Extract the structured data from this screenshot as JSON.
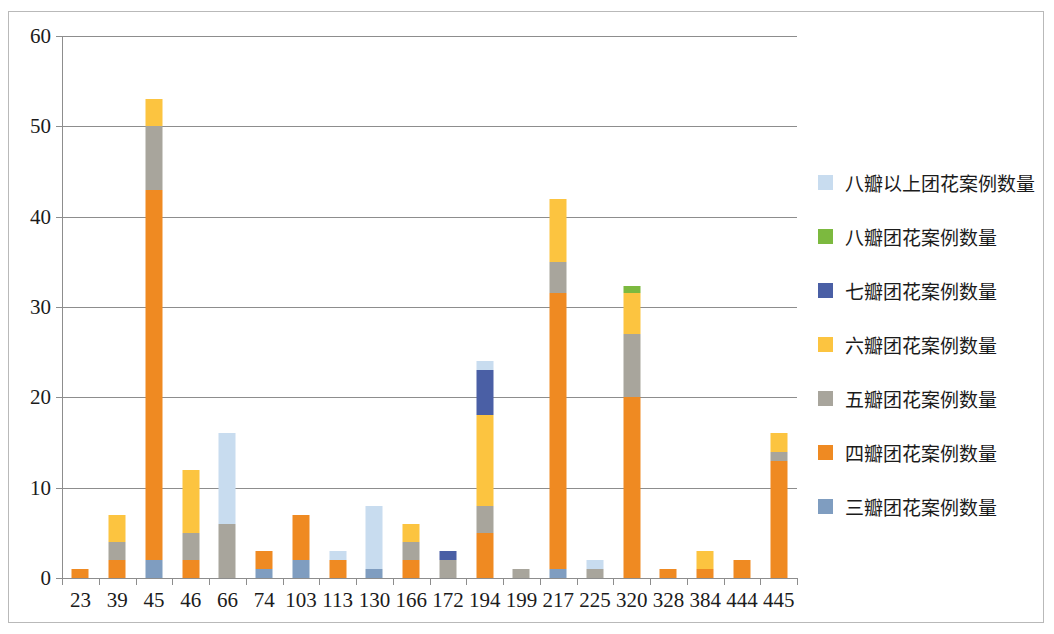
{
  "chart_data": {
    "type": "bar",
    "subtype": "stacked-bar",
    "title": "",
    "xlabel": "",
    "ylabel": "",
    "ylim": [
      0,
      60
    ],
    "ytick_step": 10,
    "yticks": [
      0,
      10,
      20,
      30,
      40,
      50,
      60
    ],
    "grid": true,
    "grid_axis": "y",
    "legend_position": "right",
    "categories": [
      "23",
      "39",
      "45",
      "46",
      "66",
      "74",
      "103",
      "113",
      "130",
      "166",
      "172",
      "194",
      "199",
      "217",
      "225",
      "320",
      "328",
      "384",
      "444",
      "445"
    ],
    "series": [
      {
        "name": "三瓣团花案例数量",
        "color": "#7f9dc0",
        "values": [
          0,
          0,
          2,
          0,
          0,
          1,
          2,
          0,
          1,
          0,
          0,
          0,
          0,
          1,
          0,
          0,
          0,
          0,
          0,
          0
        ]
      },
      {
        "name": "四瓣团花案例数量",
        "color": "#ef8a22",
        "values": [
          1,
          2,
          41,
          2,
          0,
          2,
          5,
          2,
          0,
          2,
          0,
          5,
          0,
          30.5,
          0,
          20,
          1,
          1,
          2,
          13
        ]
      },
      {
        "name": "五瓣团花案例数量",
        "color": "#a8a59c",
        "values": [
          0,
          2,
          7,
          3,
          6,
          0,
          0,
          0,
          0,
          2,
          2,
          3,
          1,
          3.5,
          1,
          7,
          0,
          0,
          0,
          1
        ]
      },
      {
        "name": "六瓣团花案例数量",
        "color": "#fcc440",
        "values": [
          0,
          3,
          3,
          7,
          0,
          0,
          0,
          0,
          0,
          2,
          0,
          10,
          0,
          7,
          0,
          4.5,
          0,
          2,
          0,
          2
        ]
      },
      {
        "name": "七瓣团花案例数量",
        "color": "#4a5fa5",
        "values": [
          0,
          0,
          0,
          0,
          0,
          0,
          0,
          0,
          0,
          0,
          1,
          5,
          0,
          0,
          0,
          0,
          0,
          0,
          0,
          0
        ]
      },
      {
        "name": "八瓣团花案例数量",
        "color": "#7cb93f",
        "values": [
          0,
          0,
          0,
          0,
          0,
          0,
          0,
          0,
          0,
          0,
          0,
          0,
          0,
          0,
          0,
          0.8,
          0,
          0,
          0,
          0
        ]
      },
      {
        "name": "八瓣以上团花案例数量",
        "color": "#c8dcef",
        "values": [
          0,
          0,
          0,
          0,
          10,
          0,
          0,
          1,
          7,
          0,
          0,
          1,
          0,
          0,
          1,
          0,
          0,
          0,
          0,
          0
        ]
      }
    ],
    "totals": [
      1,
      7,
      53,
      12,
      16,
      3,
      7,
      3,
      8,
      6,
      3,
      24,
      1,
      42,
      2,
      32.3,
      1,
      3,
      2,
      16
    ]
  },
  "legend": {
    "items": [
      {
        "label": "八瓣以上团花案例数量",
        "color": "#c8dcef"
      },
      {
        "label": "八瓣团花案例数量",
        "color": "#7cb93f"
      },
      {
        "label": "七瓣团花案例数量",
        "color": "#4a5fa5"
      },
      {
        "label": "六瓣团花案例数量",
        "color": "#fcc440"
      },
      {
        "label": "五瓣团花案例数量",
        "color": "#a8a59c"
      },
      {
        "label": "四瓣团花案例数量",
        "color": "#ef8a22"
      },
      {
        "label": "三瓣团花案例数量",
        "color": "#7f9dc0"
      }
    ]
  },
  "axis_colors": {
    "grid": "#8d8d8d",
    "text": "#1b1b1b",
    "frame": "#b9b9b9"
  }
}
